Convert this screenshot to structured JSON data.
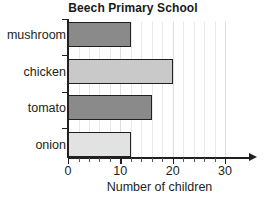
{
  "chart_data": {
    "type": "bar",
    "orientation": "horizontal",
    "title": "Beech Primary School",
    "xlabel": "Number of children",
    "ylabel": "",
    "categories": [
      "mushroom",
      "chicken",
      "tomato",
      "onion"
    ],
    "values": [
      12,
      20,
      16,
      12
    ],
    "bar_colors": [
      "#8a8a8a",
      "#c9c9c9",
      "#8a8a8a",
      "#e2e2e2"
    ],
    "bar_edge_color": "#231f20",
    "xlim": [
      0,
      30
    ],
    "xticks": [
      0,
      10,
      20,
      30
    ],
    "xtick_labels": [
      "0",
      "10",
      "20",
      "30"
    ],
    "x_minor_tick_step": 2,
    "grid": true,
    "grid_color": "#e9e9ea",
    "legend": null,
    "axis_arrow_x": true
  }
}
